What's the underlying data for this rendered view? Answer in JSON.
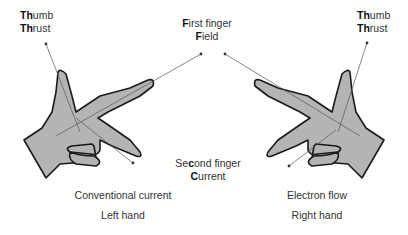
{
  "diagram": {
    "left": {
      "thumb": {
        "line1_bold": "Th",
        "line1_rest": "umb",
        "line2_bold": "Th",
        "line2_rest": "rust"
      },
      "caption": "Conventional current",
      "hand": "Left hand"
    },
    "right": {
      "thumb": {
        "line1_bold": "Th",
        "line1_rest": "umb",
        "line2_bold": "Th",
        "line2_rest": "rust"
      },
      "caption": "Electron flow",
      "hand": "Right hand"
    },
    "first_finger": {
      "line1_bold": "F",
      "line1_rest": "irst finger",
      "line2_bold": "F",
      "line2_rest": "ield"
    },
    "second_finger": {
      "line1_pre": "Se",
      "line1_bold": "c",
      "line1_rest": "ond finger",
      "line2_bold": "C",
      "line2_rest": "urrent"
    },
    "colors": {
      "hand_fill": "#b4b4b4",
      "outline": "#1a1a1a",
      "text": "#333333"
    }
  }
}
